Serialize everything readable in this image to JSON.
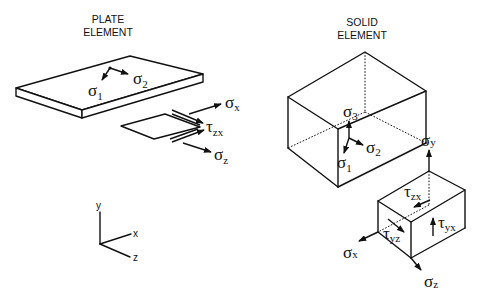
{
  "plate": {
    "title_line1": "PLATE",
    "title_line2": "ELEMENT",
    "principal_labels": [
      {
        "sym": "σ",
        "sub": "1"
      },
      {
        "sym": "σ",
        "sub": "2"
      }
    ],
    "detail_labels": [
      {
        "sym": "σ",
        "sub": "x"
      },
      {
        "sym": "τ",
        "sub": "zx"
      },
      {
        "sym": "σ",
        "sub": "z"
      }
    ]
  },
  "solid": {
    "title_line1": "SOLID",
    "title_line2": "ELEMENT",
    "principal_labels": [
      {
        "sym": "σ",
        "sub": "3"
      },
      {
        "sym": "σ",
        "sub": "2"
      },
      {
        "sym": "σ",
        "sub": "1"
      }
    ],
    "detail_labels": [
      {
        "sym": "σ",
        "sub": "y"
      },
      {
        "sym": "τ",
        "sub": "zx"
      },
      {
        "sym": "τ",
        "sub": "yx"
      },
      {
        "sym": "τ",
        "sub": "yz"
      },
      {
        "sym": "σ",
        "sub": "x"
      },
      {
        "sym": "σ",
        "sub": "z"
      }
    ]
  },
  "axes": {
    "y": "y",
    "x": "x",
    "z": "z"
  }
}
